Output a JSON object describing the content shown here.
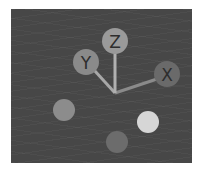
{
  "gizmo": {
    "title": "navigation-gizmo",
    "origin": {
      "x": 115,
      "y": 93
    },
    "axes": [
      {
        "label": "X",
        "cx": 167,
        "cy": 74,
        "r": 13,
        "color": "#6a6a6a"
      },
      {
        "label": "Y",
        "cx": 86,
        "cy": 62,
        "r": 13,
        "color": "#8a8a8a"
      },
      {
        "label": "Z",
        "cx": 115,
        "cy": 41,
        "r": 13,
        "color": "#9a9a9a"
      }
    ],
    "negative_axes": [
      {
        "name": "neg-y",
        "cx": 64,
        "cy": 110,
        "r": 11,
        "color": "#8c8c8c"
      },
      {
        "name": "neg-x",
        "cx": 148,
        "cy": 122,
        "r": 11,
        "color": "#d6d6d6"
      },
      {
        "name": "neg-z",
        "cx": 117,
        "cy": 142,
        "r": 11,
        "color": "#6c6c6c"
      }
    ],
    "line_color": "#a8a8a8",
    "background": "#474747"
  }
}
